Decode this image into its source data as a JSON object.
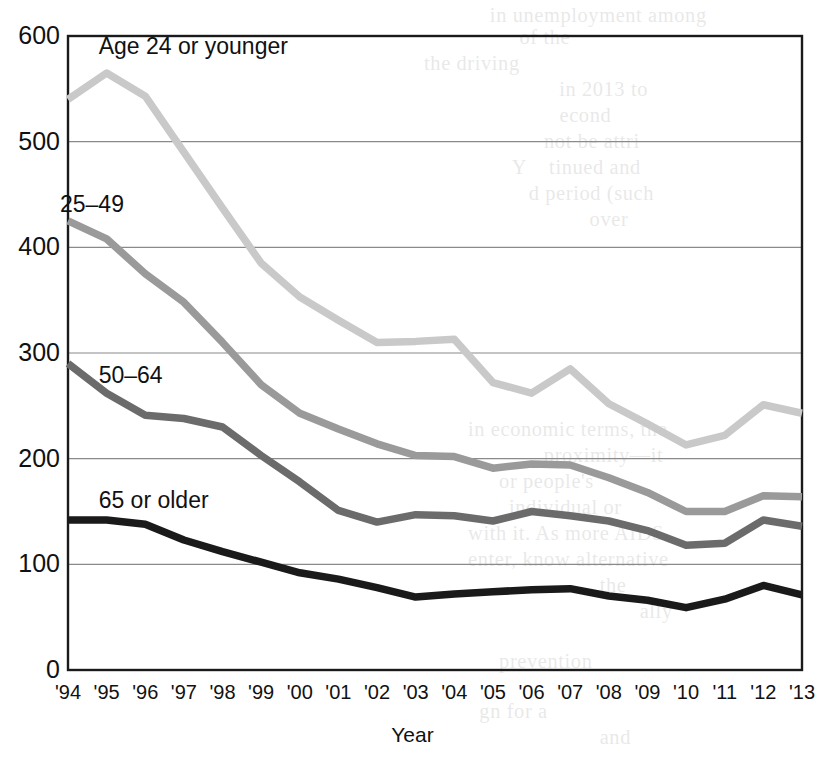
{
  "chart_data": {
    "type": "line",
    "title": "",
    "xlabel": "Year",
    "ylabel": "",
    "ylim": [
      0,
      600
    ],
    "yticks": [
      0,
      100,
      200,
      300,
      400,
      500,
      600
    ],
    "grid": true,
    "legend_position": "inline-labels",
    "x": [
      "'94",
      "'95",
      "'96",
      "'97",
      "'98",
      "'99",
      "'00",
      "'01",
      "'02",
      "'03",
      "'04",
      "'05",
      "'06",
      "'07",
      "'08",
      "'09",
      "'10",
      "'11",
      "'12",
      "'13"
    ],
    "categories": [
      "'94",
      "'95",
      "'96",
      "'97",
      "'98",
      "'99",
      "'00",
      "'01",
      "'02",
      "'03",
      "'04",
      "'05",
      "'06",
      "'07",
      "'08",
      "'09",
      "'10",
      "'11",
      "'12",
      "'13"
    ],
    "series": [
      {
        "name": "Age 24 or younger",
        "color": "#c9c9c9",
        "values": [
          540,
          565,
          543,
          490,
          437,
          385,
          353,
          331,
          310,
          311,
          313,
          272,
          262,
          285,
          252,
          233,
          213,
          222,
          251,
          243
        ],
        "label_x": "'95",
        "label_y": 588
      },
      {
        "name": "25–49",
        "color": "#9a9a9a",
        "values": [
          425,
          408,
          375,
          348,
          310,
          270,
          243,
          228,
          214,
          203,
          202,
          191,
          195,
          194,
          182,
          168,
          150,
          150,
          165,
          164
        ],
        "label_x": "'94",
        "label_y": 438
      },
      {
        "name": "50–64",
        "color": "#6b6b6b",
        "values": [
          290,
          262,
          241,
          238,
          230,
          203,
          178,
          151,
          140,
          147,
          146,
          141,
          150,
          146,
          141,
          132,
          118,
          120,
          142,
          136
        ],
        "label_x": "'95",
        "label_y": 276
      },
      {
        "name": "65 or older",
        "color": "#1a1a1a",
        "values": [
          142,
          142,
          138,
          123,
          112,
          102,
          92,
          86,
          78,
          69,
          72,
          74,
          76,
          77,
          70,
          66,
          59,
          67,
          80,
          71
        ],
        "label_x": "'95",
        "label_y": 158
      }
    ]
  },
  "labels": {
    "x_axis_title": "Year"
  },
  "bleed_text": [
    {
      "text": "in unemployment among",
      "x": 492,
      "y": 4
    },
    {
      "text": "of the",
      "x": 520,
      "y": 26
    },
    {
      "text": "the driving",
      "x": 425,
      "y": 52
    },
    {
      "text": "in 2013 to",
      "x": 560,
      "y": 78
    },
    {
      "text": "econd",
      "x": 560,
      "y": 104
    },
    {
      "text": "not be attri",
      "x": 545,
      "y": 130
    },
    {
      "text": "Y",
      "x": 512,
      "y": 156
    },
    {
      "text": "tinued and",
      "x": 550,
      "y": 156
    },
    {
      "text": "d period (such",
      "x": 530,
      "y": 182
    },
    {
      "text": "over",
      "x": 590,
      "y": 208
    },
    {
      "text": "in economic terms, the",
      "x": 470,
      "y": 418
    },
    {
      "text": "proximity—it",
      "x": 545,
      "y": 444
    },
    {
      "text": "or people's",
      "x": 500,
      "y": 470
    },
    {
      "text": "individual or",
      "x": 510,
      "y": 496
    },
    {
      "text": "with it. As more AIDS",
      "x": 470,
      "y": 522
    },
    {
      "text": "enter, know alternative",
      "x": 470,
      "y": 548
    },
    {
      "text": "the",
      "x": 600,
      "y": 574
    },
    {
      "text": "ally",
      "x": 640,
      "y": 600
    },
    {
      "text": "prevention",
      "x": 500,
      "y": 650
    },
    {
      "text": "gn for a",
      "x": 480,
      "y": 700
    },
    {
      "text": "and",
      "x": 600,
      "y": 726
    }
  ]
}
